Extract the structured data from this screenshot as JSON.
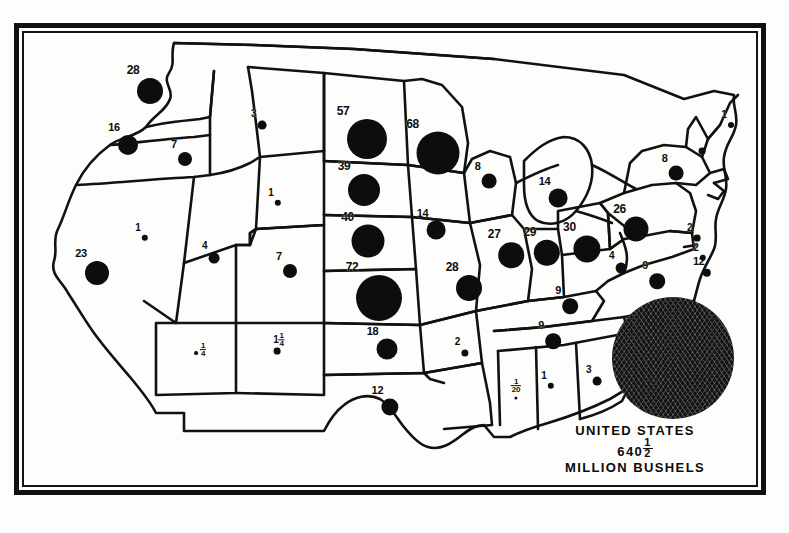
{
  "figure": {
    "background_color": "#fdfdfb",
    "ink_color": "#0d0d0d"
  },
  "legend": {
    "country_label": "UNITED STATES",
    "total_value": "640",
    "total_fraction_num": "1",
    "total_fraction_den": "2",
    "units_label": "MILLION BUSHELS"
  },
  "chart_data": {
    "type": "bubble_map",
    "value_units": "million bushels",
    "symbol": "graduated filled circle, area proportional to value",
    "total": 640.5,
    "xlabel": "",
    "ylabel": "",
    "grid": false,
    "legend_position": "bottom-right",
    "categories": [
      "Washington",
      "Oregon",
      "Idaho",
      "California",
      "Nevada",
      "Utah",
      "Arizona",
      "Montana",
      "Wyoming",
      "Colorado",
      "New Mexico",
      "North Dakota",
      "South Dakota",
      "Nebraska",
      "Kansas",
      "Oklahoma",
      "Texas",
      "Minnesota",
      "Iowa",
      "Missouri",
      "Arkansas",
      "Louisiana",
      "Wisconsin",
      "Illinois",
      "Michigan",
      "Indiana",
      "Ohio",
      "Kentucky",
      "Tennessee",
      "Mississippi",
      "Alabama",
      "Georgia",
      "Florida",
      "South Carolina",
      "North Carolina",
      "Virginia",
      "West Virginia",
      "Maryland",
      "Delaware",
      "Pennsylvania",
      "New Jersey",
      "New York",
      "Maine",
      "Vermont",
      "New Hampshire",
      "Massachusetts",
      "Connecticut",
      "Rhode Island"
    ],
    "values": [
      28,
      16,
      7,
      23,
      1,
      4,
      0.25,
      3,
      1,
      7,
      1.25,
      57,
      68,
      39,
      40,
      18,
      12,
      null,
      14,
      28,
      2,
      null,
      8,
      27,
      14,
      29,
      30,
      9,
      9,
      0.05,
      1,
      3,
      null,
      2,
      6,
      9,
      4,
      12,
      2,
      26,
      2,
      8,
      1,
      null,
      null,
      null,
      null,
      null
    ],
    "labels": [
      {
        "state": "Washington",
        "text": "28",
        "value": 28,
        "x": 126,
        "y": 58,
        "r": 13
      },
      {
        "state": "Oregon",
        "text": "16",
        "value": 16,
        "x": 104,
        "y": 112,
        "r": 10
      },
      {
        "state": "Idaho",
        "text": "7",
        "value": 7,
        "x": 161,
        "y": 126,
        "r": 7
      },
      {
        "state": "California",
        "text": "23",
        "value": 23,
        "x": 73,
        "y": 240,
        "r": 12
      },
      {
        "state": "Nevada",
        "text": "1",
        "value": 1,
        "x": 121,
        "y": 205,
        "r": 3.2
      },
      {
        "state": "Utah",
        "text": "4",
        "value": 4,
        "x": 190,
        "y": 225,
        "r": 5.4
      },
      {
        "state": "Arizona",
        "text": "¼",
        "value": 0.25,
        "x": 172,
        "y": 320,
        "r": 1.9
      },
      {
        "state": "Montana",
        "text": "3",
        "value": 3,
        "x": 238,
        "y": 92,
        "r": 4.4
      },
      {
        "state": "Wyoming",
        "text": "1",
        "value": 1,
        "x": 254,
        "y": 170,
        "r": 3.2
      },
      {
        "state": "Colorado",
        "text": "7",
        "value": 7,
        "x": 266,
        "y": 238,
        "r": 7
      },
      {
        "state": "New Mexico",
        "text": "1¼",
        "value": 1.25,
        "x": 253,
        "y": 318,
        "r": 3.4
      },
      {
        "state": "North Dakota",
        "text": "57",
        "value": 57,
        "x": 343,
        "y": 106,
        "r": 20
      },
      {
        "state": "South Dakota",
        "text": "39",
        "value": 39,
        "x": 340,
        "y": 157,
        "r": 16
      },
      {
        "state": "Nebraska",
        "text": "40",
        "value": 40,
        "x": 344,
        "y": 208,
        "r": 16.5
      },
      {
        "state": "Kansas",
        "text": "72",
        "value": 72,
        "x": 355,
        "y": 265,
        "r": 23
      },
      {
        "state": "Oklahoma",
        "text": "18",
        "value": 18,
        "x": 363,
        "y": 316,
        "r": 10.5
      },
      {
        "state": "Texas",
        "text": "12",
        "value": 12,
        "x": 366,
        "y": 374,
        "r": 8.6
      },
      {
        "state": "Minnesota",
        "text": "68",
        "value": 68,
        "x": 414,
        "y": 120,
        "r": 21.5
      },
      {
        "state": "Iowa",
        "text": "14",
        "value": 14,
        "x": 412,
        "y": 197,
        "r": 9.4
      },
      {
        "state": "Missouri",
        "text": "28",
        "value": 28,
        "x": 445,
        "y": 255,
        "r": 13
      },
      {
        "state": "Arkansas",
        "text": "2",
        "value": 2,
        "x": 441,
        "y": 320,
        "r": 3.6
      },
      {
        "state": "Wisconsin",
        "text": "8",
        "value": 8,
        "x": 465,
        "y": 148,
        "r": 7.4
      },
      {
        "state": "Michigan",
        "text": "14",
        "value": 14,
        "x": 534,
        "y": 165,
        "r": 9.4
      },
      {
        "state": "Illinois",
        "text": "27",
        "value": 27,
        "x": 487,
        "y": 222,
        "r": 12.8
      },
      {
        "state": "Indiana",
        "text": "29",
        "value": 29,
        "x": 523,
        "y": 220,
        "r": 13.2
      },
      {
        "state": "Ohio",
        "text": "30",
        "value": 30,
        "x": 563,
        "y": 216,
        "r": 13.6
      },
      {
        "state": "Kentucky",
        "text": "9",
        "value": 9,
        "x": 546,
        "y": 273,
        "r": 7.8
      },
      {
        "state": "Tennessee",
        "text": "9",
        "value": 9,
        "x": 529,
        "y": 308,
        "r": 7.8
      },
      {
        "state": "Mississippi",
        "text": "1/20",
        "value": 0.05,
        "x": 492,
        "y": 365,
        "r": 1.6
      },
      {
        "state": "Alabama",
        "text": "1",
        "value": 1,
        "x": 527,
        "y": 353,
        "r": 3.2
      },
      {
        "state": "Georgia",
        "text": "3",
        "value": 3,
        "x": 573,
        "y": 348,
        "r": 4.4
      },
      {
        "state": "South Carolina",
        "text": "2",
        "value": 2,
        "x": 606,
        "y": 320,
        "r": 3.6
      },
      {
        "state": "North Carolina",
        "text": "6",
        "value": 6,
        "x": 626,
        "y": 295,
        "r": 6.4
      },
      {
        "state": "Virginia",
        "text": "9",
        "value": 9,
        "x": 633,
        "y": 248,
        "r": 7.8
      },
      {
        "state": "West Virginia",
        "text": "4",
        "value": 4,
        "x": 597,
        "y": 235,
        "r": 5.4
      },
      {
        "state": "Maryland",
        "text": "12",
        "value": 12,
        "x": 683,
        "y": 240,
        "r": 4.2
      },
      {
        "state": "Delaware",
        "text": "2",
        "value": 2,
        "x": 679,
        "y": 225,
        "r": 3.2
      },
      {
        "state": "Pennsylvania",
        "text": "26",
        "value": 26,
        "x": 612,
        "y": 196,
        "r": 12.5
      },
      {
        "state": "New Jersey",
        "text": "2",
        "value": 2,
        "x": 673,
        "y": 205,
        "r": 3.4
      },
      {
        "state": "New York",
        "text": "8",
        "value": 8,
        "x": 652,
        "y": 140,
        "r": 7.4
      },
      {
        "state": "Maine",
        "text": "1",
        "value": 1,
        "x": 707,
        "y": 92,
        "r": 3.0
      },
      {
        "state": "Vermont",
        "text": "",
        "value": null,
        "x": 678,
        "y": 118,
        "r": 3.4
      }
    ]
  }
}
